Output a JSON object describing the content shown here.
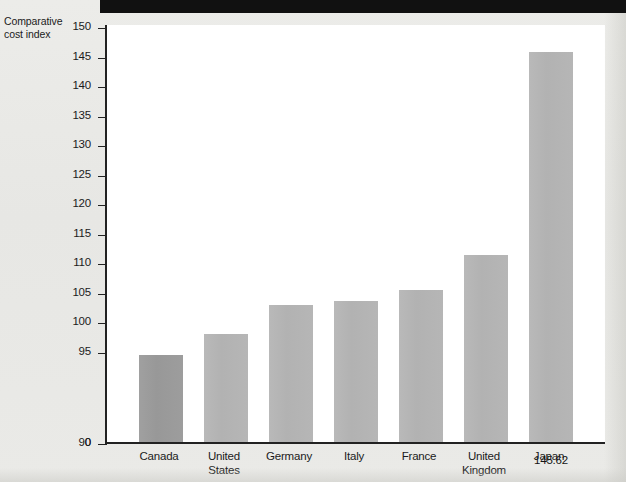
{
  "chart_data": {
    "type": "bar",
    "title": "",
    "ylabel": "Comparative cost index",
    "xlabel": "",
    "categories": [
      "Canada",
      "United States",
      "Germany",
      "Italy",
      "France",
      "United Kingdom",
      "Japan"
    ],
    "values": [
      94.16,
      97.72,
      102.66,
      103.37,
      105.21,
      111.25,
      145.62
    ],
    "value_labels": [
      "94.16",
      "97.72",
      "102.66",
      "103.37",
      "105.21",
      "111.25",
      "145.62"
    ],
    "category_lines": [
      [
        "Canada"
      ],
      [
        "United",
        "States"
      ],
      [
        "Germany"
      ],
      [
        "Italy"
      ],
      [
        "France"
      ],
      [
        "United",
        "Kingdom"
      ],
      [
        "Japan"
      ]
    ],
    "ytick_labels": [
      "150",
      "145",
      "140",
      "135",
      "130",
      "125",
      "120",
      "115",
      "110",
      "105",
      "100",
      "95",
      "90",
      "0"
    ],
    "ytick_values": [
      150,
      145,
      140,
      135,
      130,
      125,
      120,
      115,
      110,
      105,
      100,
      95,
      90,
      0
    ],
    "ylim": [
      90,
      150
    ],
    "axis_break_below": 90,
    "zero_label": "0",
    "grid": false,
    "legend": "none",
    "highlight_index": 0,
    "colors": {
      "bar": "#b4b4b4",
      "bar_highlight": "#9a9a9a",
      "axis": "#222222",
      "text": "#1b1b1b",
      "plot_background": "#ffffff",
      "page_background": "#e9e9e7",
      "header_band": "#111111"
    }
  },
  "caption": {
    "axis_title_line1": "Comparative",
    "axis_title_line2": "cost index"
  }
}
